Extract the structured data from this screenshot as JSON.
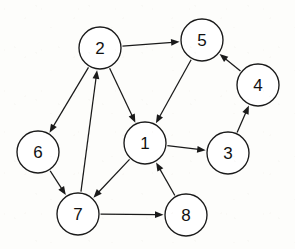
{
  "diagram": {
    "background_color": "#fdfdfb",
    "node_fill": "#ffffff",
    "node_stroke": "#1a1a1a",
    "edge_color": "#1a1a1a",
    "node_radius": 21,
    "width": 295,
    "height": 249
  },
  "chart_data": {
    "type": "diagram",
    "directed": true,
    "node_count": 8,
    "edge_count": 12,
    "nodes": [
      {
        "id": "1",
        "label": "1",
        "x": 145,
        "y": 143
      },
      {
        "id": "2",
        "label": "2",
        "x": 100,
        "y": 48
      },
      {
        "id": "3",
        "label": "3",
        "x": 228,
        "y": 153
      },
      {
        "id": "4",
        "label": "4",
        "x": 258,
        "y": 85
      },
      {
        "id": "5",
        "label": "5",
        "x": 202,
        "y": 40
      },
      {
        "id": "6",
        "label": "6",
        "x": 38,
        "y": 152
      },
      {
        "id": "7",
        "label": "7",
        "x": 78,
        "y": 214
      },
      {
        "id": "8",
        "label": "8",
        "x": 186,
        "y": 215
      }
    ],
    "edges": [
      {
        "from": "2",
        "to": "5"
      },
      {
        "from": "2",
        "to": "6"
      },
      {
        "from": "2",
        "to": "1"
      },
      {
        "from": "5",
        "to": "1"
      },
      {
        "from": "4",
        "to": "5"
      },
      {
        "from": "3",
        "to": "4"
      },
      {
        "from": "1",
        "to": "3"
      },
      {
        "from": "1",
        "to": "7"
      },
      {
        "from": "6",
        "to": "7"
      },
      {
        "from": "7",
        "to": "2"
      },
      {
        "from": "7",
        "to": "8"
      },
      {
        "from": "8",
        "to": "1"
      }
    ]
  }
}
